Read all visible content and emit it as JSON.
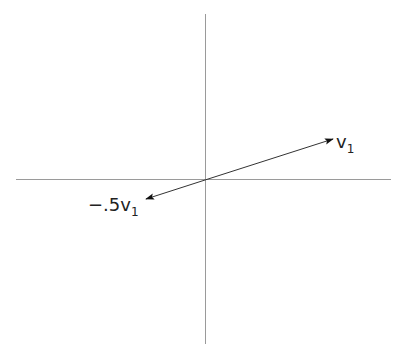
{
  "diagram": {
    "axes": {
      "x_axis": {
        "x1": 16,
        "x2": 391,
        "y": 179
      },
      "y_axis": {
        "x": 206,
        "y1": 14,
        "y2": 344
      },
      "color": "#9a9a9a"
    },
    "origin": [
      205,
      180
    ],
    "vectors": [
      {
        "name": "v1",
        "label_main": "v",
        "label_sub": "1",
        "tip": [
          333,
          139
        ],
        "label_pos": [
          336,
          148
        ]
      },
      {
        "name": "neg-half-v1",
        "label_main": "−.5v",
        "label_sub": "1",
        "tip": [
          146,
          199
        ],
        "label_pos": [
          88,
          212
        ]
      }
    ],
    "vector_color": "#222222"
  }
}
